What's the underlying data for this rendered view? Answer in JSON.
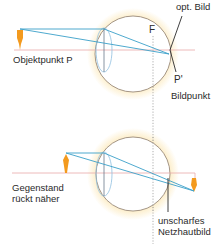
{
  "colors": {
    "axis": "#e8a8a8",
    "ray": "#3a9fc8",
    "eye_outline": "#9a8a7a",
    "glow": "#fbe3a8",
    "object": "#f39a1e",
    "lens": "#8fbfe0",
    "retina_line": "#3a3a3a",
    "focal_line": "#9a9a9a",
    "text": "#2a2a2a"
  },
  "top_diagram": {
    "object_label": "Objektpunkt P",
    "focal_label": "F",
    "image_label": "opt. Bild",
    "image_point_label": "P'",
    "image_point_caption": "Bildpunkt"
  },
  "bottom_diagram": {
    "object_label_line1": "Gegenstand",
    "object_label_line2": "rückt näher",
    "retina_label_line1": "unscharfes",
    "retina_label_line2": "Netzhautbild"
  }
}
